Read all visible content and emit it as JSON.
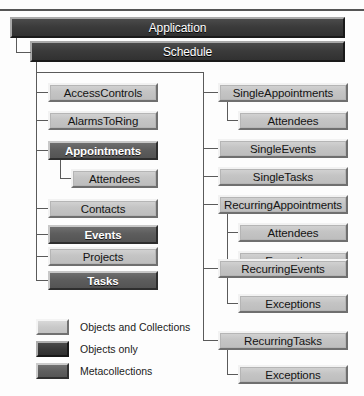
{
  "diagram": {
    "title_banners": [
      {
        "label": "Application",
        "style": "dark"
      },
      {
        "label": "Schedule",
        "style": "dark"
      }
    ],
    "left_column": [
      {
        "label": "AccessControls",
        "style": "light",
        "level": 1
      },
      {
        "label": "AlarmsToRing",
        "style": "light",
        "level": 1
      },
      {
        "label": "Appointments",
        "style": "meta",
        "level": 1
      },
      {
        "label": "Attendees",
        "style": "light",
        "level": 2
      },
      {
        "label": "Contacts",
        "style": "light",
        "level": 1
      },
      {
        "label": "Events",
        "style": "meta",
        "level": 1
      },
      {
        "label": "Projects",
        "style": "light",
        "level": 1
      },
      {
        "label": "Tasks",
        "style": "meta",
        "level": 1
      }
    ],
    "right_column": [
      {
        "label": "SingleAppointments",
        "style": "light",
        "level": 1
      },
      {
        "label": "Attendees",
        "style": "light",
        "level": 2
      },
      {
        "label": "SingleEvents",
        "style": "light",
        "level": 1
      },
      {
        "label": "SingleTasks",
        "style": "light",
        "level": 1
      },
      {
        "label": "RecurringAppointments",
        "style": "light",
        "level": 1
      },
      {
        "label": "Attendees",
        "style": "light",
        "level": 2
      },
      {
        "label": "Exceptions",
        "style": "light",
        "level": 2
      },
      {
        "label": "RecurringEvents",
        "style": "light",
        "level": 1
      },
      {
        "label": "Exceptions",
        "style": "light",
        "level": 2
      },
      {
        "label": "RecurringTasks",
        "style": "light",
        "level": 1
      },
      {
        "label": "Exceptions",
        "style": "light",
        "level": 2
      }
    ],
    "legend": [
      {
        "label": "Objects and Collections",
        "style": "light"
      },
      {
        "label": "Objects only",
        "style": "dark"
      },
      {
        "label": "Metacollections",
        "style": "meta"
      }
    ],
    "colors": {
      "light_fill": "#c7c7c7",
      "dark_fill": "#3b3b3b",
      "meta_fill": "#5d5d5d",
      "line": "#5a5a5a",
      "background": "#fdfdfd"
    }
  }
}
